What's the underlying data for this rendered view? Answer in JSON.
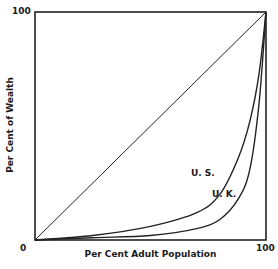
{
  "chart_data": {
    "type": "line",
    "title": "",
    "xlabel": "Per Cent Adult Population",
    "ylabel": "Per Cent of Wealth",
    "xlim": [
      0,
      100
    ],
    "ylim": [
      0,
      100
    ],
    "x_ticks": [
      "0",
      "100"
    ],
    "y_ticks": [
      "0",
      "100"
    ],
    "grid": false,
    "legend": "inline labels",
    "series": [
      {
        "name": "Equality line",
        "x": [
          0,
          100
        ],
        "y": [
          0,
          100
        ]
      },
      {
        "name": "U. S.",
        "x": [
          0,
          25,
          50,
          70,
          80,
          88,
          93,
          97,
          100
        ],
        "y": [
          0,
          2,
          6,
          12,
          20,
          36,
          52,
          73,
          100
        ]
      },
      {
        "name": "U. K.",
        "x": [
          0,
          25,
          50,
          70,
          80,
          88,
          93,
          97,
          100
        ],
        "y": [
          0,
          1,
          2,
          5,
          9,
          18,
          31,
          60,
          100
        ]
      }
    ],
    "annotations": [
      "U. S.",
      "U. K."
    ]
  },
  "labels": {
    "x_axis": "Per Cent Adult Population",
    "y_axis": "Per Cent of Wealth",
    "origin": "0",
    "x_max": "100",
    "y_max": "100",
    "us": "U. S.",
    "uk": "U. K."
  }
}
